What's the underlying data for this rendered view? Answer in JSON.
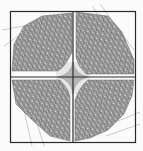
{
  "diagram": {
    "type": "quilt-block",
    "quadrants": [
      "top-left",
      "top-right",
      "bottom-left",
      "bottom-right"
    ],
    "colors": {
      "background": "#fbfbfb",
      "frame": "#2a2a2a",
      "petal_fill": "#8a8a8a",
      "weave_light": "#d8d8d8",
      "weave_dark": "#6e6e6e",
      "guide_line": "#a8a8a8",
      "center_star": "#b8b8b8",
      "center_field": "#e6e6e6"
    }
  }
}
